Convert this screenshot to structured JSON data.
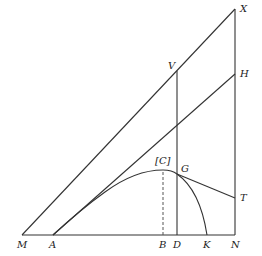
{
  "diagram": {
    "points": {
      "M": {
        "label": "M",
        "x": 22,
        "y": 235
      },
      "A": {
        "label": "A",
        "x": 53,
        "y": 235
      },
      "B": {
        "label": "B",
        "x": 163,
        "y": 235
      },
      "D": {
        "label": "D",
        "x": 177,
        "y": 235
      },
      "K": {
        "label": "K",
        "x": 207,
        "y": 235
      },
      "N": {
        "label": "N",
        "x": 235,
        "y": 235
      },
      "X": {
        "label": "X",
        "x": 235,
        "y": 9
      },
      "H": {
        "label": "H",
        "x": 235,
        "y": 74
      },
      "V": {
        "label": "V",
        "x": 176,
        "y": 71
      },
      "T": {
        "label": "T",
        "x": 235,
        "y": 198
      },
      "G": {
        "label": "G",
        "x": 177,
        "y": 174
      },
      "C": {
        "label": "[C]",
        "x": 163,
        "y": 170
      }
    },
    "labels": [
      "X",
      "V",
      "H",
      "[C]",
      "G",
      "T",
      "M",
      "A",
      "B",
      "D",
      "K",
      "N"
    ]
  }
}
